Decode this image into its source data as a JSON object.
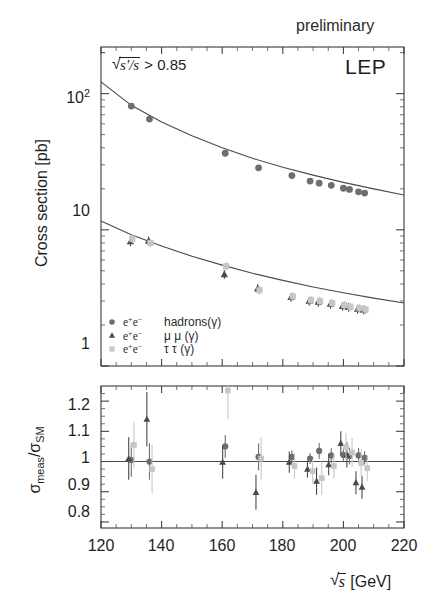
{
  "figure": {
    "preliminary_label": "preliminary",
    "experiment_label": "LEP",
    "selection_cut": "> 0.85",
    "selection_cut_var_num": "s'",
    "selection_cut_var_den": "s"
  },
  "axes": {
    "top": {
      "ylabel": "Cross section [pb]",
      "yticks": [
        "10",
        "10",
        "1"
      ],
      "ytick_exponents": [
        "2",
        "",
        ""
      ],
      "ylim": [
        1,
        220
      ],
      "scale": "log"
    },
    "bottom": {
      "ylabel_num": "meas",
      "ylabel_den": "SM",
      "ylabel_sigma": "σ",
      "yticks": [
        "1.2",
        "1.1",
        "1",
        "0.9",
        "0.8"
      ],
      "ylim": [
        0.78,
        1.25
      ]
    },
    "x": {
      "label_unit": "[GeV]",
      "label_var": "s",
      "ticks": [
        "120",
        "140",
        "160",
        "180",
        "200",
        "220"
      ],
      "xlim": [
        120,
        220
      ],
      "minor_step": 5
    }
  },
  "legend": {
    "items": [
      {
        "marker": "circle-marker",
        "initial": "e",
        "sup1": "+",
        "sup2": "−",
        "final": "hadrons(γ)"
      },
      {
        "marker": "triangle-marker",
        "initial": "e",
        "sup1": "+",
        "sup2": "−",
        "final": "μ μ (γ)"
      },
      {
        "marker": "square-marker",
        "initial": "e",
        "sup1": "+",
        "sup2": "−",
        "final": "τ τ (γ)"
      }
    ]
  },
  "colors": {
    "hadrons": "#6e6e6e",
    "muons": "#4a4a4a",
    "taus": "#c6c6c6",
    "frame": "#3a3a3a",
    "curve": "#4a4a4a"
  },
  "chart_data": {
    "type": "scatter",
    "xlabel": "√s [GeV]",
    "ylabel": "Cross section [pb]",
    "xlim": [
      120,
      220
    ],
    "ylim": [
      1,
      220
    ],
    "yscale": "log",
    "grid": false,
    "legend_position": "lower-left",
    "panels": [
      {
        "name": "cross-section-panel",
        "series": [
          {
            "name": "hadrons(γ)",
            "marker": "circle",
            "color": "#6e6e6e",
            "x": [
              130,
              136,
              161,
              172,
              183,
              189,
              192,
              196,
              200,
              202,
              205,
              207
            ],
            "y": [
              81,
              65,
              36.5,
              28.5,
              25.0,
              22.8,
              22.0,
              21.2,
              20.2,
              19.8,
              19.0,
              18.6
            ]
          },
          {
            "name": "μ⁺μ⁻(γ)",
            "marker": "triangle",
            "color": "#4a4a4a",
            "x": [
              130,
              136,
              161,
              172,
              183,
              189,
              192,
              196,
              200,
              202,
              205,
              207
            ],
            "y": [
              8.2,
              8.3,
              4.7,
              3.7,
              3.2,
              3.0,
              2.95,
              2.85,
              2.75,
              2.7,
              2.62,
              2.58
            ]
          },
          {
            "name": "τ⁺τ⁻(γ)",
            "marker": "square",
            "color": "#c6c6c6",
            "x": [
              130,
              136,
              161,
              172,
              183,
              189,
              192,
              196,
              200,
              202,
              205,
              207
            ],
            "y": [
              8.6,
              8.0,
              5.4,
              3.6,
              3.25,
              3.05,
              3.0,
              2.9,
              2.8,
              2.72,
              2.66,
              2.6
            ]
          }
        ],
        "curves": [
          {
            "name": "SM hadrons",
            "x": [
              120,
              130,
              140,
              150,
              160,
              170,
              180,
              190,
              200,
              210,
              220
            ],
            "y": [
              122,
              82,
              62,
              49,
              40,
              33.5,
              28.8,
              25.2,
              22.3,
              20.0,
              18.0
            ]
          },
          {
            "name": "SM leptons",
            "x": [
              120,
              130,
              140,
              150,
              160,
              170,
              180,
              190,
              200,
              210,
              220
            ],
            "y": [
              11.6,
              9.2,
              7.6,
              6.4,
              5.5,
              4.8,
              4.25,
              3.8,
              3.45,
              3.15,
              2.9
            ]
          }
        ]
      },
      {
        "name": "ratio-panel",
        "ylabel": "σmeas/σSM",
        "ylim": [
          0.78,
          1.25
        ],
        "reference_line": 1.0,
        "series": [
          {
            "name": "hadrons(γ)",
            "marker": "circle",
            "color": "#6e6e6e",
            "points": [
              {
                "x": 130,
                "y": 1.005,
                "err": 0.055
              },
              {
                "x": 136,
                "y": 1.0,
                "err": 0.06
              },
              {
                "x": 161,
                "y": 1.05,
                "err": 0.038
              },
              {
                "x": 172,
                "y": 1.015,
                "err": 0.045
              },
              {
                "x": 183,
                "y": 1.015,
                "err": 0.022
              },
              {
                "x": 189,
                "y": 1.01,
                "err": 0.018
              },
              {
                "x": 192,
                "y": 1.035,
                "err": 0.026
              },
              {
                "x": 196,
                "y": 1.02,
                "err": 0.024
              },
              {
                "x": 200,
                "y": 1.022,
                "err": 0.023
              },
              {
                "x": 202,
                "y": 1.018,
                "err": 0.028
              },
              {
                "x": 205,
                "y": 1.02,
                "err": 0.025
              },
              {
                "x": 207,
                "y": 1.012,
                "err": 0.022
              }
            ]
          },
          {
            "name": "μ⁺μ⁻(γ)",
            "marker": "triangle",
            "color": "#4a4a4a",
            "points": [
              {
                "x": 130,
                "y": 1.01,
                "err": 0.07
              },
              {
                "x": 136,
                "y": 1.14,
                "err": 0.09
              },
              {
                "x": 161,
                "y": 0.998,
                "err": 0.055
              },
              {
                "x": 172,
                "y": 0.898,
                "err": 0.058
              },
              {
                "x": 183,
                "y": 0.998,
                "err": 0.035
              },
              {
                "x": 189,
                "y": 0.975,
                "err": 0.028
              },
              {
                "x": 192,
                "y": 0.935,
                "err": 0.045
              },
              {
                "x": 196,
                "y": 0.99,
                "err": 0.035
              },
              {
                "x": 200,
                "y": 1.06,
                "err": 0.04
              },
              {
                "x": 202,
                "y": 1.022,
                "err": 0.042
              },
              {
                "x": 205,
                "y": 0.93,
                "err": 0.038
              },
              {
                "x": 207,
                "y": 0.915,
                "err": 0.038
              }
            ]
          },
          {
            "name": "τ⁺τ⁻(γ)",
            "marker": "square",
            "color": "#c6c6c6",
            "points": [
              {
                "x": 130,
                "y": 1.055,
                "err": 0.075
              },
              {
                "x": 136,
                "y": 0.975,
                "err": 0.08
              },
              {
                "x": 161,
                "y": 1.235,
                "err": 0.095
              },
              {
                "x": 172,
                "y": 1.01,
                "err": 0.07
              },
              {
                "x": 183,
                "y": 0.985,
                "err": 0.042
              },
              {
                "x": 189,
                "y": 0.968,
                "err": 0.04
              },
              {
                "x": 192,
                "y": 0.945,
                "err": 0.055
              },
              {
                "x": 196,
                "y": 0.985,
                "err": 0.042
              },
              {
                "x": 200,
                "y": 1.048,
                "err": 0.045
              },
              {
                "x": 202,
                "y": 1.03,
                "err": 0.048
              },
              {
                "x": 205,
                "y": 0.995,
                "err": 0.045
              },
              {
                "x": 207,
                "y": 0.978,
                "err": 0.042
              }
            ]
          }
        ]
      }
    ]
  }
}
